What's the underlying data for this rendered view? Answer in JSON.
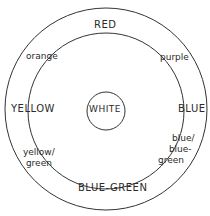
{
  "diagram": {
    "type": "color-wheel",
    "stroke_color": "#333333",
    "center_label": "WHITE",
    "outer_ring_labels": {
      "top": "RED",
      "left": "YELLOW",
      "right": "BLUE",
      "bottom": "BLUE-GREEN"
    },
    "intermediate_labels": {
      "upper_left": "orange",
      "upper_right": "purple",
      "lower_left": [
        "yellow/",
        "green"
      ],
      "lower_right": [
        "blue/",
        "blue-",
        "green"
      ]
    }
  }
}
